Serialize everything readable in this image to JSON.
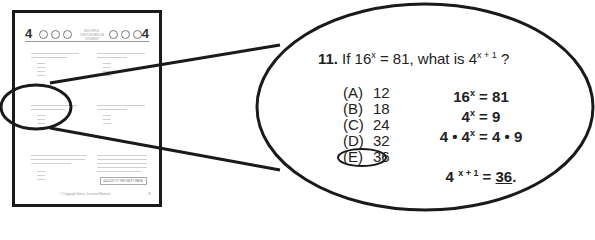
{
  "thumbnail": {
    "section_number": "4",
    "header_title": "MULTIPLE-CHOICE/GRID-IN STUDENT",
    "footer_text": "© Copyright Notice, Licensed Material",
    "go_on_label": "GO ON TO THE NEXT PAGE",
    "page_number": "29"
  },
  "zoom": {
    "question_number": "11.",
    "question_prefix": "If 16",
    "question_exp1": "x",
    "question_mid": " = 81, what is 4",
    "question_exp2": "x + 1",
    "question_suffix": " ?",
    "choices": [
      {
        "label": "(A)",
        "value": "12"
      },
      {
        "label": "(B)",
        "value": "18"
      },
      {
        "label": "(C)",
        "value": "24"
      },
      {
        "label": "(D)",
        "value": "32"
      },
      {
        "label": "(E)",
        "value": "36"
      }
    ],
    "selected_choice": "E",
    "work": {
      "line1_base": "16",
      "line1_exp": "x",
      "line1_rest": " = 81",
      "line2_base": "4",
      "line2_exp": "x",
      "line2_rest": " = 9",
      "line3_a": "4  •  4",
      "line3_exp": "x",
      "line3_b": " = 4  •  9",
      "line4_base": "4 ",
      "line4_exp": "x + 1",
      "line4_eq": " =  ",
      "line4_answer": "36",
      "line4_end": "."
    }
  }
}
